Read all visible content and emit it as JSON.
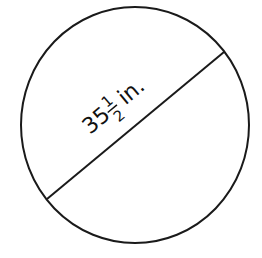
{
  "figure": {
    "shape": "circle",
    "stroke_color": "#1a1a1a",
    "background": "#ffffff",
    "diameter_label": {
      "whole": "35",
      "numerator": "1",
      "denominator": "2",
      "unit": "in."
    }
  }
}
